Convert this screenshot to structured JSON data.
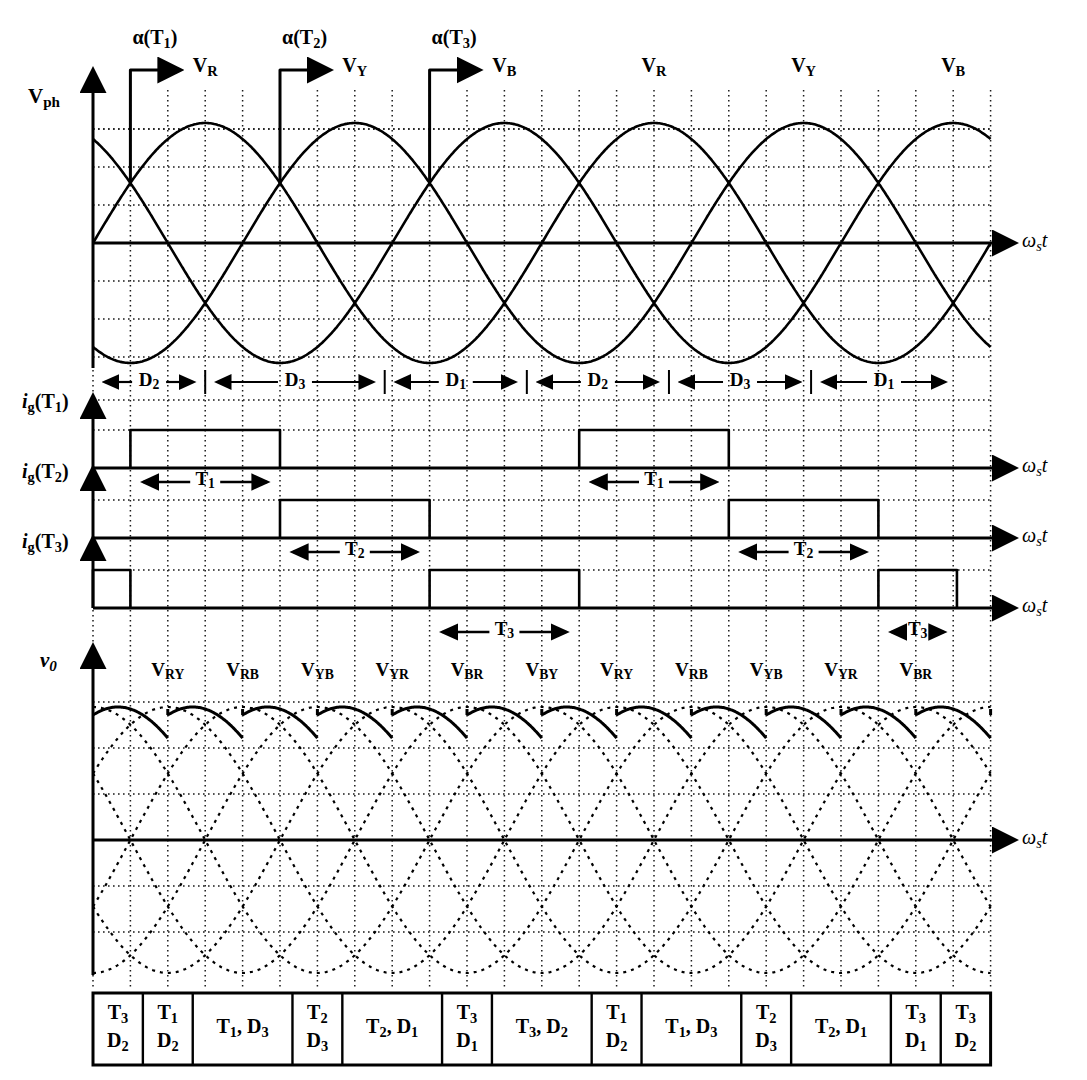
{
  "figure": {
    "title_axes_label": "ωst"
  },
  "axes": [
    {
      "id": "vph",
      "y_label": "Vph",
      "x_label": "ωst"
    },
    {
      "id": "ig_t1",
      "y_label": "ig(T1)",
      "x_label": "ωst"
    },
    {
      "id": "ig_t2",
      "y_label": "ig(T2)",
      "x_label": "ωst"
    },
    {
      "id": "ig_t3",
      "y_label": "ig(T3)",
      "x_label": "ωst"
    },
    {
      "id": "vo",
      "y_label": "v0",
      "x_label": "ωst"
    }
  ],
  "firing_angle_markers": [
    {
      "label": "α(T1)",
      "col": 1
    },
    {
      "label": "α(T2)",
      "col": 5
    },
    {
      "label": "α(T3)",
      "col": 9
    }
  ],
  "phase_labels": [
    {
      "text": "VR",
      "col": 3
    },
    {
      "text": "VY",
      "col": 7
    },
    {
      "text": "VB",
      "col": 11
    },
    {
      "text": "VR",
      "col": 15
    },
    {
      "text": "VY",
      "col": 19
    },
    {
      "text": "VB",
      "col": 23
    }
  ],
  "diode_conduction_bands": [
    {
      "label": "D2",
      "start_col": 0,
      "end_col": 3
    },
    {
      "label": "D3",
      "start_col": 3,
      "end_col": 7.8
    },
    {
      "label": "D1",
      "start_col": 7.8,
      "end_col": 11.6
    },
    {
      "label": "D2",
      "start_col": 11.6,
      "end_col": 15.4
    },
    {
      "label": "D3",
      "start_col": 15.4,
      "end_col": 19.2
    },
    {
      "label": "D1",
      "start_col": 19.2,
      "end_col": 23.1
    }
  ],
  "gate_pulses": {
    "ig_t1": [
      {
        "start_col": 1,
        "end_col": 5
      },
      {
        "start_col": 13,
        "end_col": 17
      }
    ],
    "ig_t2": [
      {
        "start_col": 5,
        "end_col": 9
      },
      {
        "start_col": 17,
        "end_col": 21
      }
    ],
    "ig_t3": [
      {
        "start_col": 0,
        "end_col": 1
      },
      {
        "start_col": 9,
        "end_col": 13
      },
      {
        "start_col": 21,
        "end_col": 23.1
      }
    ]
  },
  "conduction_interval_markers": [
    {
      "label": "T1",
      "axis": "ig_t2",
      "start_col": 1,
      "end_col": 5
    },
    {
      "label": "T1",
      "axis": "ig_t2",
      "start_col": 13,
      "end_col": 17
    },
    {
      "label": "T2",
      "axis": "ig_t3",
      "start_col": 5,
      "end_col": 9
    },
    {
      "label": "T2",
      "axis": "ig_t3",
      "start_col": 17,
      "end_col": 21
    },
    {
      "label": "T3",
      "axis": "vo",
      "start_col": 9,
      "end_col": 13
    },
    {
      "label": "T3",
      "axis": "vo",
      "start_col": 21,
      "end_col": 23.1
    }
  ],
  "output_voltage_labels": [
    {
      "text": "VRY",
      "col": 2
    },
    {
      "text": "VRB",
      "col": 4
    },
    {
      "text": "VYB",
      "col": 6
    },
    {
      "text": "VYR",
      "col": 8
    },
    {
      "text": "VBR",
      "col": 10
    },
    {
      "text": "VBY",
      "col": 12
    },
    {
      "text": "VRY",
      "col": 14
    },
    {
      "text": "VRB",
      "col": 16
    },
    {
      "text": "VYB",
      "col": 18
    },
    {
      "text": "VYR",
      "col": 20
    },
    {
      "text": "VBR",
      "col": 22
    }
  ],
  "conduction_table": {
    "cells": [
      {
        "top": "T3",
        "bottom": "D2",
        "inline": null,
        "span": 1
      },
      {
        "top": "T1",
        "bottom": "D2",
        "inline": null,
        "span": 1
      },
      {
        "top": null,
        "bottom": null,
        "inline": "T1, D3",
        "span": 2
      },
      {
        "top": "T2",
        "bottom": "D3",
        "inline": null,
        "span": 1
      },
      {
        "top": null,
        "bottom": null,
        "inline": "T2, D1",
        "span": 2
      },
      {
        "top": "T3",
        "bottom": "D1",
        "inline": null,
        "span": 1
      },
      {
        "top": null,
        "bottom": null,
        "inline": "T3, D2",
        "span": 2
      },
      {
        "top": "T1",
        "bottom": "D2",
        "inline": null,
        "span": 1
      },
      {
        "top": null,
        "bottom": null,
        "inline": "T1, D3",
        "span": 2
      },
      {
        "top": "T2",
        "bottom": "D3",
        "inline": null,
        "span": 1
      },
      {
        "top": null,
        "bottom": null,
        "inline": "T2, D1",
        "span": 2
      },
      {
        "top": "T3",
        "bottom": "D1",
        "inline": null,
        "span": 1
      },
      {
        "top": "T3",
        "bottom": "D2",
        "inline": null,
        "span": 1
      }
    ]
  },
  "colors": {
    "ink": "#000000",
    "grid": "#1a1a1a",
    "background": "#ffffff"
  },
  "chart_data": {
    "type": "line",
    "xlabel": "ωst",
    "grid": true,
    "x_grid_columns": 24,
    "series": [
      {
        "name": "VR",
        "kind": "sine",
        "phase_deg": 0,
        "axis": "vph"
      },
      {
        "name": "VY",
        "kind": "sine",
        "phase_deg": -120,
        "axis": "vph"
      },
      {
        "name": "VB",
        "kind": "sine",
        "phase_deg": -240,
        "axis": "vph"
      },
      {
        "name": "ig(T1)",
        "kind": "pulse",
        "axis": "ig_t1"
      },
      {
        "name": "ig(T2)",
        "kind": "pulse",
        "axis": "ig_t2"
      },
      {
        "name": "ig(T3)",
        "kind": "pulse",
        "axis": "ig_t3"
      },
      {
        "name": "v0",
        "kind": "rectified-line-voltage",
        "axis": "vo"
      }
    ]
  }
}
